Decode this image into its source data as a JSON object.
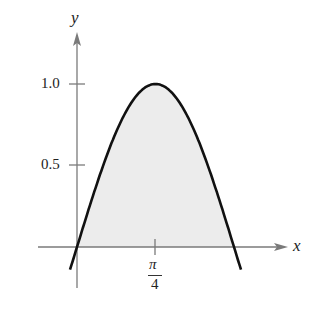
{
  "chart_data": {
    "type": "area",
    "function": "y = sin(2x)",
    "title": "",
    "xlabel": "x",
    "ylabel": "y",
    "x_ticks": [
      {
        "value": 0.7854,
        "label": "π/4"
      }
    ],
    "y_ticks": [
      {
        "value": 0.5,
        "label": "0.5"
      },
      {
        "value": 1.0,
        "label": "1.0"
      }
    ],
    "shaded_region": {
      "from": 0,
      "to": 1.5708,
      "color": "#ececec"
    },
    "x": [
      0,
      0.1963,
      0.3927,
      0.589,
      0.7854,
      0.9817,
      1.1781,
      1.3744,
      1.5708
    ],
    "values": [
      0,
      0.3827,
      0.7071,
      0.9239,
      1.0,
      0.9239,
      0.7071,
      0.3827,
      0
    ],
    "grid": false,
    "curve_color": "#111111",
    "axis_color": "#7a7a7a"
  },
  "labels": {
    "y_axis": "y",
    "x_axis": "x",
    "tick_one": "1.0",
    "tick_half": "0.5",
    "pi_num": "π",
    "pi_den": "4"
  }
}
